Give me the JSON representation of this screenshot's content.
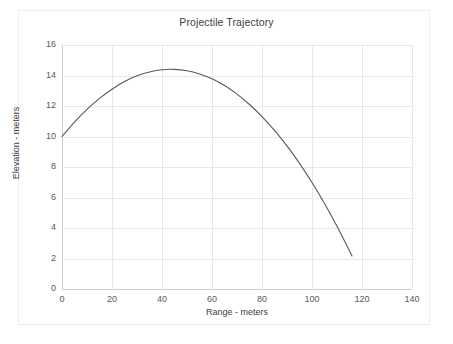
{
  "chart_data": {
    "type": "line",
    "title": "Projectile Trajectory",
    "xlabel": "Range - meters",
    "ylabel": "Elevation - meters",
    "xlim": [
      0,
      140
    ],
    "ylim": [
      0,
      16
    ],
    "xticks": [
      "0",
      "20",
      "40",
      "60",
      "80",
      "100",
      "120",
      "140"
    ],
    "yticks": [
      "0",
      "2",
      "4",
      "6",
      "8",
      "10",
      "12",
      "14",
      "16"
    ],
    "xtick_values": [
      0,
      20,
      40,
      60,
      80,
      100,
      120,
      140
    ],
    "ytick_values": [
      0,
      2,
      4,
      6,
      8,
      10,
      12,
      14,
      16
    ],
    "grid": true,
    "legend": "none",
    "series": [
      {
        "name": "Trajectory",
        "color": "#595959",
        "x": [
          0,
          5,
          10,
          15,
          20,
          25,
          30,
          35,
          40,
          45,
          50,
          55,
          60,
          65,
          70,
          75,
          80,
          85,
          90,
          95,
          100,
          105,
          110,
          115,
          116
        ],
        "y": [
          10.0,
          10.95,
          11.78,
          12.5,
          13.1,
          13.6,
          13.98,
          14.23,
          14.38,
          14.4,
          14.31,
          14.1,
          13.78,
          13.34,
          12.78,
          12.1,
          11.31,
          10.4,
          9.38,
          8.24,
          6.98,
          5.61,
          4.12,
          2.51,
          2.16
        ]
      }
    ],
    "annotations": {
      "start_point": {
        "x": 0,
        "y": 10
      },
      "peak_point": {
        "x": 48,
        "y": 14.4
      },
      "landing_point": {
        "x": 116,
        "y": 0
      }
    }
  },
  "colors": {
    "curve": "#595959",
    "grid": "#e8e8e8",
    "axis": "#d0d0d0",
    "text": "#595959",
    "title_text": "#404040",
    "background": "#ffffff",
    "outer_border": "#eeeeee"
  }
}
